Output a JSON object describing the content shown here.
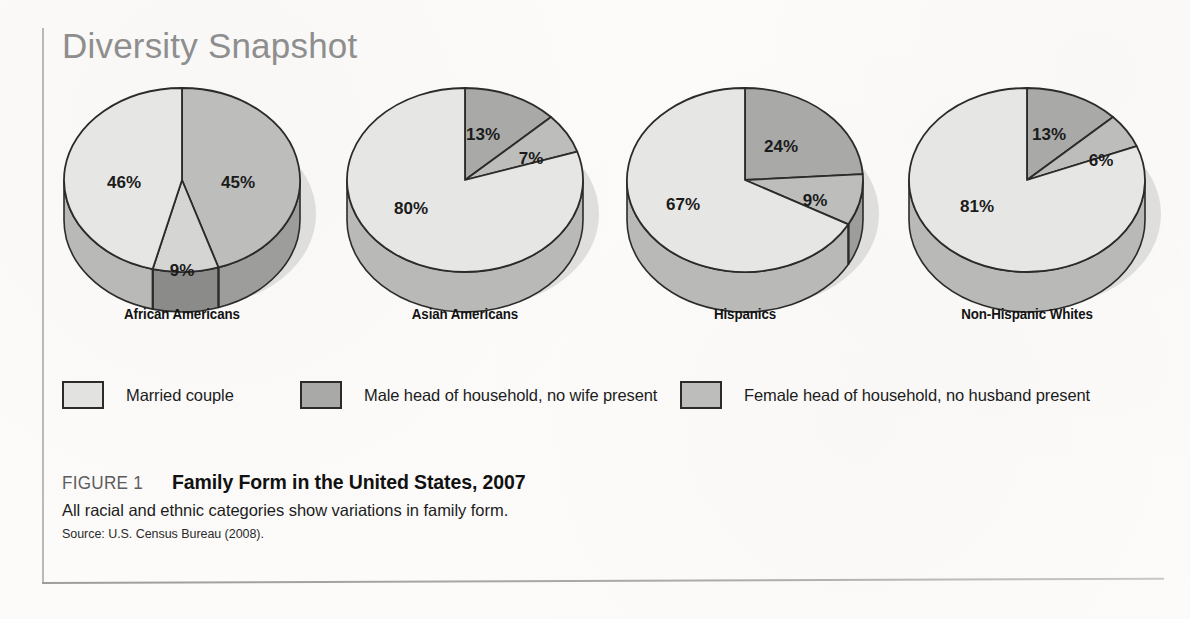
{
  "header": {
    "title": "Diversity Snapshot"
  },
  "legend": {
    "items": [
      {
        "label": "Married couple",
        "color": "#e2e2e0",
        "key": "married"
      },
      {
        "label": "Male head of household, no wife present",
        "color": "#a9a9a7",
        "key": "male_head"
      },
      {
        "label": "Female head of household, no husband present",
        "color": "#bdbdbb",
        "key": "female_head"
      }
    ]
  },
  "caption": {
    "figure_number": "FIGURE 1",
    "title": "Family Form in the United States, 2007",
    "description": "All racial and ethnic categories show variations in family form.",
    "source": "Source: U.S. Census Bureau (2008)."
  },
  "colors": {
    "married": "#e2e2e0",
    "male_head": "#a9a9a7",
    "female_head": "#bdbdbb",
    "outline": "#2b2b2b",
    "side_married": "#b9b9b7",
    "side_male": "#8b8b89",
    "side_female": "#9d9d9b",
    "shadow": "#c9c9c7",
    "title": "#8e8e8e",
    "rule": "#b9b9b9"
  },
  "chart_data": {
    "type": "pie",
    "title": "Family Form in the United States, 2007",
    "subtitle": "All racial and ethnic categories show variations in family form.",
    "units": "percent",
    "legend_position": "bottom",
    "series_names": [
      "Married couple",
      "Male head of household, no wife present",
      "Female head of household, no husband present"
    ],
    "charts": [
      {
        "name": "African Americans",
        "slices": [
          {
            "label": "45%",
            "value": 45,
            "category": "Female head of household, no husband present",
            "color": "#bdbdbb"
          },
          {
            "label": "9%",
            "value": 9,
            "category": "Male head of household, no wife present",
            "color": "#d5d5d3"
          },
          {
            "label": "46%",
            "value": 46,
            "category": "Married couple",
            "color": "#e6e6e4"
          }
        ]
      },
      {
        "name": "Asian Americans",
        "slices": [
          {
            "label": "13%",
            "value": 13,
            "category": "Male head of household, no wife present",
            "color": "#a9a9a7"
          },
          {
            "label": "7%",
            "value": 7,
            "category": "Female head of household, no husband present",
            "color": "#bdbdbb"
          },
          {
            "label": "80%",
            "value": 80,
            "category": "Married couple",
            "color": "#e6e6e4"
          }
        ]
      },
      {
        "name": "Hispanics",
        "slices": [
          {
            "label": "24%",
            "value": 24,
            "category": "Male head of household, no wife present",
            "color": "#a9a9a7"
          },
          {
            "label": "9%",
            "value": 9,
            "category": "Female head of household, no husband present",
            "color": "#bdbdbb"
          },
          {
            "label": "67%",
            "value": 67,
            "category": "Married couple",
            "color": "#e6e6e4"
          }
        ]
      },
      {
        "name": "Non-Hispanic Whites",
        "slices": [
          {
            "label": "13%",
            "value": 13,
            "category": "Male head of household, no wife present",
            "color": "#a9a9a7"
          },
          {
            "label": "6%",
            "value": 6,
            "category": "Female head of household, no husband present",
            "color": "#bdbdbb"
          },
          {
            "label": "81%",
            "value": 81,
            "category": "Married couple",
            "color": "#e6e6e4"
          }
        ]
      }
    ]
  }
}
